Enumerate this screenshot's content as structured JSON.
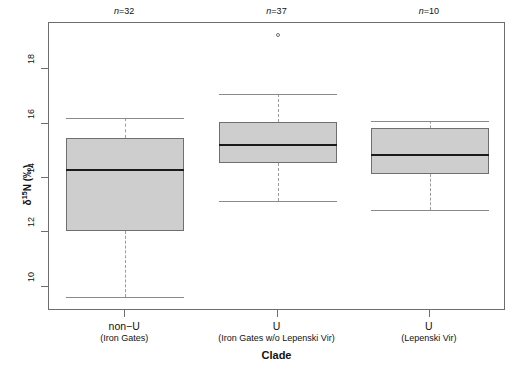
{
  "figure": {
    "background_color": "#ffffff",
    "frame_color": "#6d6d6d",
    "box_fill_color": "#cecece",
    "box_border_color": "#6f6f6f",
    "median_color": "#1a1a1a",
    "whisker_color": "#9a9a9a"
  },
  "axes": {
    "y_title_prefix": "δ",
    "y_title_super": "15",
    "y_title_suffix": "N (‰)",
    "y_ticks": [
      "10",
      "12",
      "14",
      "16",
      "18"
    ],
    "x_title": "Clade"
  },
  "annotations": {
    "n_labels": [
      "n=32",
      "n=37",
      "n=10"
    ],
    "n_prefix": "n",
    "n_values": [
      "=32",
      "=37",
      "=10"
    ]
  },
  "categories": [
    {
      "main": "non−U",
      "sub": "(Iron Gates)"
    },
    {
      "main": "U",
      "sub": "(Iron Gates w/o Lepenski Vir)"
    },
    {
      "main": "U",
      "sub": "(Lepenski Vir)"
    }
  ],
  "chart_data": {
    "type": "box",
    "title": "",
    "xlabel": "Clade",
    "ylabel": "δ15N (‰)",
    "ylim": [
      9.1,
      19.7
    ],
    "y_ticks": [
      10,
      12,
      14,
      16,
      18
    ],
    "grid": false,
    "legend": "none",
    "categories": [
      "non−U (Iron Gates)",
      "U (Iron Gates w/o Lepenski Vir)",
      "U (Lepenski Vir)"
    ],
    "n": [
      32,
      37,
      10
    ],
    "boxes": [
      {
        "category": "non−U (Iron Gates)",
        "n": 32,
        "whisker_low": 9.6,
        "q1": 12.05,
        "median": 14.3,
        "q3": 15.45,
        "whisker_high": 16.2,
        "outliers": []
      },
      {
        "category": "U (Iron Gates w/o Lepenski Vir)",
        "n": 37,
        "whisker_low": 13.15,
        "q1": 14.55,
        "median": 15.2,
        "q3": 16.05,
        "whisker_high": 17.1,
        "outliers": [
          19.25
        ]
      },
      {
        "category": "U (Lepenski Vir)",
        "n": 10,
        "whisker_low": 12.8,
        "q1": 14.15,
        "median": 14.85,
        "q3": 15.85,
        "whisker_high": 16.1,
        "outliers": []
      }
    ]
  }
}
